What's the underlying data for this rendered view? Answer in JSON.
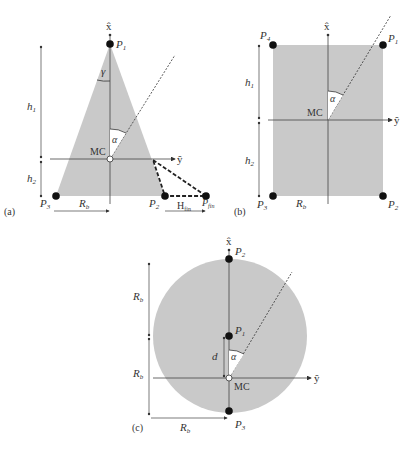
{
  "panels": {
    "a": {
      "tag": "(a)",
      "axis_x": "x̂",
      "axis_y": "ŷ",
      "points": {
        "p1": "P",
        "p1_sub": "1",
        "p2": "P",
        "p2_sub": "2",
        "p3": "P",
        "p3_sub": "3",
        "pfin": "P",
        "pfin_sub": "fin"
      },
      "center": "MC",
      "h1": "h",
      "h1_sub": "1",
      "h2": "h",
      "h2_sub": "2",
      "rb": "R",
      "rb_sub": "b",
      "hfin": "H",
      "hfin_sub": "fin",
      "gamma": "γ",
      "alpha": "α"
    },
    "b": {
      "tag": "(b)",
      "axis_x": "x̂",
      "axis_y": "ŷ",
      "points": {
        "p1": "P",
        "p1_sub": "1",
        "p2": "P",
        "p2_sub": "2",
        "p3": "P",
        "p3_sub": "3",
        "p4": "P",
        "p4_sub": "4"
      },
      "center": "MC",
      "h1": "h",
      "h1_sub": "1",
      "h2": "h",
      "h2_sub": "2",
      "rb": "R",
      "rb_sub": "b",
      "alpha": "α"
    },
    "c": {
      "tag": "(c)",
      "axis_x": "x̂",
      "axis_y": "ŷ",
      "points": {
        "p1": "P",
        "p1_sub": "1",
        "p2": "P",
        "p2_sub": "2",
        "p3": "P",
        "p3_sub": "3"
      },
      "center": "MC",
      "rb_top": "R",
      "rb_top_sub": "b",
      "rb_mid": "R",
      "rb_mid_sub": "b",
      "rb_bottom": "R",
      "rb_bottom_sub": "b",
      "d": "d",
      "alpha": "α"
    }
  },
  "colors": {
    "fill": "#c8c8c8",
    "line": "#333333",
    "point": "#111111"
  }
}
